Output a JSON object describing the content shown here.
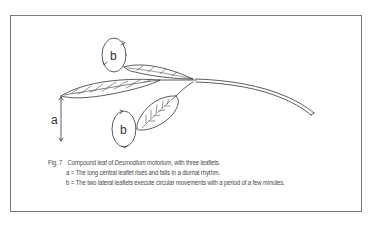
{
  "figure": {
    "number_label": "Fig. 7",
    "caption": {
      "title_prefix": "Compound leaf of ",
      "title_species": "Desmodium motorium",
      "title_suffix": ", with three leaflets.",
      "line_a": "a = The long central leaflet rises and falls in a diurnal rhythm.",
      "line_b": "b = The two lateral leaflets execute circular movements with a period of a few minutes."
    },
    "diagram": {
      "label_a": "a",
      "label_b_upper": "b",
      "label_b_lower": "b",
      "stroke_color": "#333333",
      "border_color": "#7a7a7a"
    }
  }
}
